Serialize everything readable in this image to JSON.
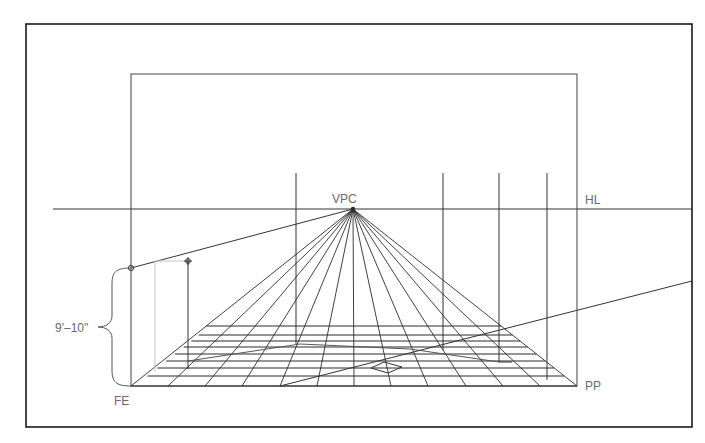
{
  "diagram": {
    "type": "one-point-perspective-construction",
    "labels": {
      "vanishing_point": "VPC",
      "horizon_line": "HL",
      "picture_plane": "PP",
      "floor_edge": "FE",
      "height_dimension": "9'–10\""
    },
    "colors": {
      "line": "#2b2b2b",
      "frame": "#1a1a1a",
      "construction_line": "#bdbdbd",
      "label": "#6a6a6a",
      "background": "#ffffff"
    },
    "frame": {
      "x": 26,
      "y": 24,
      "w": 666,
      "h": 403
    },
    "inner_rect": {
      "x": 131,
      "y": 74,
      "w": 446,
      "h": 312
    },
    "horizon_line": {
      "y": 209,
      "x1": 53,
      "x2": 692
    },
    "vpc": {
      "x": 353,
      "y": 209
    },
    "floor": {
      "y_bottom": 386,
      "x_left": 131,
      "x_right": 577,
      "radiating_bottom_x": [
        131,
        168,
        205,
        242,
        280,
        317,
        354,
        391,
        428,
        466,
        503,
        540,
        577
      ],
      "transversal_y": [
        329,
        335,
        341,
        347,
        354,
        361,
        368,
        376,
        386
      ]
    },
    "verticals": [
      {
        "x": 296,
        "y1": 173,
        "y2": 344
      },
      {
        "x": 443,
        "y1": 173,
        "y2": 350
      },
      {
        "x": 499,
        "y1": 173,
        "y2": 362
      },
      {
        "x": 547,
        "y1": 173,
        "y2": 380
      }
    ]
  }
}
